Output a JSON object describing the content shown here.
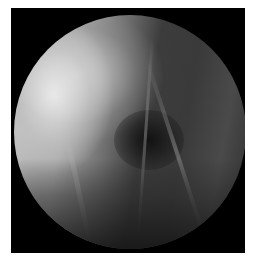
{
  "image": {
    "description": "Grayscale arthroscopic view inside a circular field of view on a black rectangular frame",
    "colors": {
      "background": "#ffffff",
      "frame": "#000000",
      "bright_tissue": "#d8d8d8",
      "dark_tissue": "#2e2e2e"
    }
  }
}
